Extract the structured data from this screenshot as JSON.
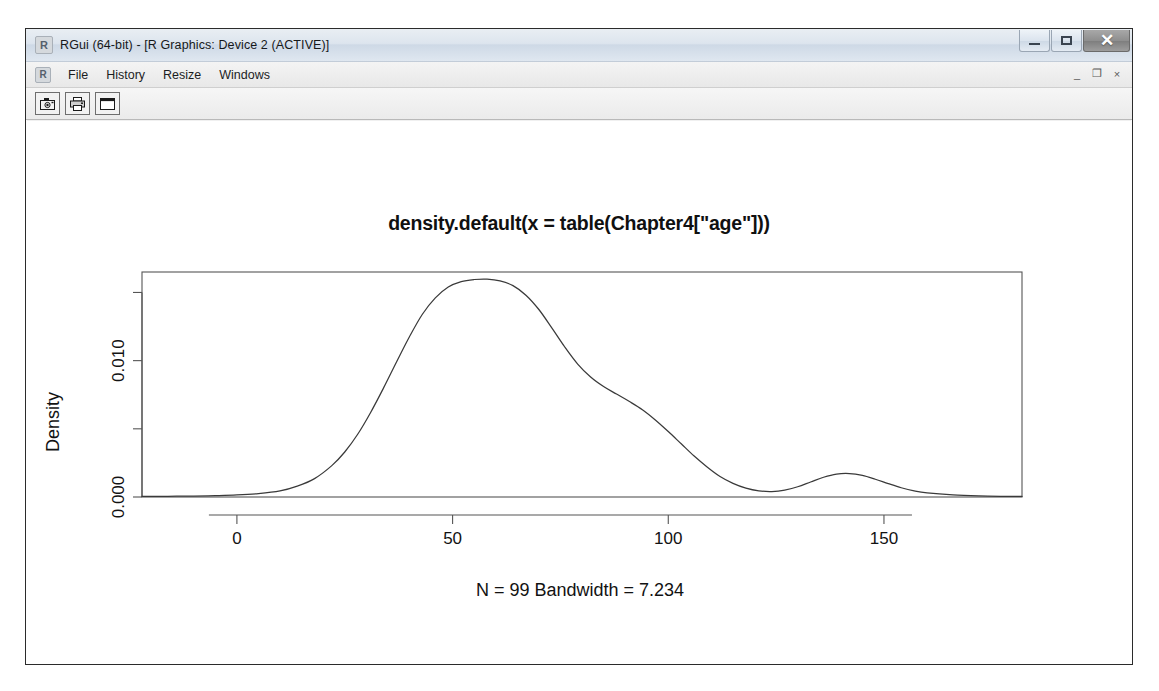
{
  "window": {
    "title": "RGui (64-bit) - [R Graphics: Device 2 (ACTIVE)]",
    "app_icon": "R",
    "controls": {
      "minimize": "minimize-icon",
      "maximize": "maximize-icon",
      "close": "✕"
    }
  },
  "mdi": {
    "icon": "R",
    "menus": [
      {
        "label": "File"
      },
      {
        "label": "History"
      },
      {
        "label": "Resize"
      },
      {
        "label": "Windows"
      }
    ],
    "controls": {
      "minimize": "_",
      "restore": "❐",
      "close": "×"
    }
  },
  "toolbar": {
    "buttons": [
      {
        "name": "copy-to-clipboard-button",
        "icon": "camera-icon"
      },
      {
        "name": "print-button",
        "icon": "printer-icon"
      },
      {
        "name": "device-window-button",
        "icon": "window-icon"
      }
    ]
  },
  "chart_data": {
    "type": "line",
    "title": "density.default(x = table(Chapter4[\"age\"]))",
    "subtitle": "N = 99   Bandwidth = 7.234",
    "xlabel": "",
    "ylabel": "Density",
    "xlim": [
      -22,
      182
    ],
    "ylim": [
      0,
      0.0165
    ],
    "grid": false,
    "legend": null,
    "axis": {
      "x_ticks": [
        0,
        50,
        100,
        150
      ],
      "x_tick_labels": [
        "0",
        "50",
        "100",
        "150"
      ],
      "y_ticks": [
        0.0,
        0.005,
        0.01,
        0.015
      ],
      "y_tick_labels": [
        "0.000",
        "",
        "0.010",
        ""
      ],
      "y_labeled_ticks": [
        0.0,
        0.01
      ],
      "y_labeled_text": [
        "0.000",
        "0.010"
      ]
    },
    "series": [
      {
        "name": "density",
        "x": [
          -22,
          -16,
          -10,
          -5,
          0,
          5,
          10,
          14,
          18,
          22,
          25,
          28,
          31,
          34,
          37,
          40,
          43,
          46,
          49,
          52,
          55,
          58,
          61,
          64,
          67,
          70,
          73,
          76,
          79,
          82,
          85,
          88,
          91,
          94,
          97,
          100,
          103,
          106,
          109,
          112,
          115,
          118,
          121,
          124,
          127,
          130,
          133,
          136,
          139,
          142,
          145,
          148,
          151,
          154,
          157,
          160,
          166,
          172,
          178,
          182
        ],
        "y": [
          4e-05,
          5e-05,
          7e-05,
          0.0001,
          0.00015,
          0.00025,
          0.00045,
          0.0008,
          0.00135,
          0.0023,
          0.0033,
          0.0046,
          0.0062,
          0.008,
          0.0099,
          0.01175,
          0.0134,
          0.0146,
          0.0154,
          0.0158,
          0.01595,
          0.01598,
          0.01585,
          0.0155,
          0.0148,
          0.01375,
          0.0124,
          0.011,
          0.00975,
          0.0088,
          0.0081,
          0.00755,
          0.007,
          0.0064,
          0.00565,
          0.0048,
          0.0039,
          0.003,
          0.0022,
          0.0015,
          0.001,
          0.00065,
          0.00045,
          0.0004,
          0.0005,
          0.00075,
          0.0011,
          0.00145,
          0.00168,
          0.00172,
          0.00158,
          0.0013,
          0.00098,
          0.00068,
          0.00045,
          0.0003,
          0.00015,
          8e-05,
          5e-05,
          4e-05
        ]
      }
    ],
    "peaks": [
      {
        "x": 57,
        "y": 0.01598,
        "label": "primary-mode"
      },
      {
        "x": 140,
        "y": 0.00172,
        "label": "secondary-mode"
      }
    ]
  }
}
